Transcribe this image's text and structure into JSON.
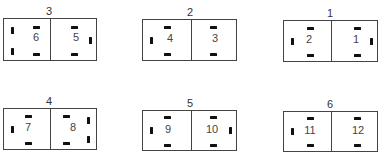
{
  "figure": {
    "units": [
      {
        "id": "unit-3",
        "label": "3",
        "x": 3,
        "y": 18,
        "w": 94,
        "h": 43,
        "divider": 46,
        "cells": [
          {
            "number": "6",
            "num_x": 22,
            "num_y": 16,
            "pins_h": [
              [
                29,
                7
              ],
              [
                29,
                34
              ]
            ],
            "pins_v": [
              [
                7,
                8
              ],
              [
                7,
                29
              ]
            ]
          },
          {
            "number": "5",
            "num_x": 62,
            "num_y": 16,
            "pins_h": [
              [
                67,
                7
              ],
              [
                67,
                34
              ]
            ],
            "pins_v": [
              [
                85,
                18
              ]
            ]
          }
        ]
      },
      {
        "id": "unit-2",
        "label": "2",
        "x": 142,
        "y": 19,
        "w": 95,
        "h": 42,
        "divider": 48,
        "cells": [
          {
            "number": "4",
            "num_x": 17,
            "num_y": 16,
            "pins_h": [
              [
                21,
                6
              ],
              [
                21,
                33
              ]
            ],
            "pins_v": [
              [
                7,
                17
              ]
            ]
          },
          {
            "number": "3",
            "num_x": 62,
            "num_y": 16,
            "pins_h": [
              [
                67,
                6
              ],
              [
                67,
                33
              ]
            ],
            "pins_v": []
          }
        ]
      },
      {
        "id": "unit-1",
        "label": "1",
        "x": 283,
        "y": 20,
        "w": 95,
        "h": 42,
        "divider": 47,
        "cells": [
          {
            "number": "2",
            "num_x": 15,
            "num_y": 16,
            "pins_h": [
              [
                23,
                6
              ],
              [
                23,
                33
              ]
            ],
            "pins_v": [
              [
                7,
                17
              ]
            ]
          },
          {
            "number": "1",
            "num_x": 62,
            "num_y": 16,
            "pins_h": [
              [
                70,
                6
              ],
              [
                70,
                33
              ]
            ],
            "pins_v": [
              [
                86,
                17
              ]
            ]
          }
        ]
      },
      {
        "id": "unit-4",
        "label": "4",
        "x": 3,
        "y": 108,
        "w": 94,
        "h": 42,
        "divider": 46,
        "cells": [
          {
            "number": "7",
            "num_x": 14,
            "num_y": 16,
            "pins_h": [
              [
                21,
                6
              ],
              [
                21,
                33
              ]
            ],
            "pins_v": [
              [
                7,
                17
              ]
            ]
          },
          {
            "number": "8",
            "num_x": 59,
            "num_y": 16,
            "pins_h": [
              [
                59,
                6
              ],
              [
                59,
                33
              ]
            ],
            "pins_v": [
              [
                83,
                8
              ],
              [
                83,
                27
              ]
            ]
          }
        ]
      },
      {
        "id": "unit-5",
        "label": "5",
        "x": 142,
        "y": 110,
        "w": 95,
        "h": 41,
        "divider": 48,
        "cells": [
          {
            "number": "9",
            "num_x": 15,
            "num_y": 16,
            "pins_h": [
              [
                21,
                5
              ],
              [
                21,
                33
              ]
            ],
            "pins_v": [
              [
                7,
                16
              ]
            ]
          },
          {
            "number": "10",
            "num_x": 59,
            "num_y": 16,
            "pins_h": [
              [
                67,
                5
              ],
              [
                67,
                33
              ]
            ],
            "pins_v": [
              [
                86,
                16
              ]
            ]
          }
        ]
      },
      {
        "id": "unit-6",
        "label": "6",
        "x": 283,
        "y": 111,
        "w": 95,
        "h": 41,
        "divider": 47,
        "cells": [
          {
            "number": "11",
            "num_x": 16,
            "num_y": 16,
            "pins_h": [
              [
                23,
                5
              ],
              [
                23,
                32
              ]
            ],
            "pins_v": [
              [
                7,
                16
              ]
            ]
          },
          {
            "number": "12",
            "num_x": 64,
            "num_y": 16,
            "pins_h": [
              [
                70,
                5
              ],
              [
                70,
                32
              ]
            ],
            "pins_v": []
          }
        ]
      }
    ]
  }
}
